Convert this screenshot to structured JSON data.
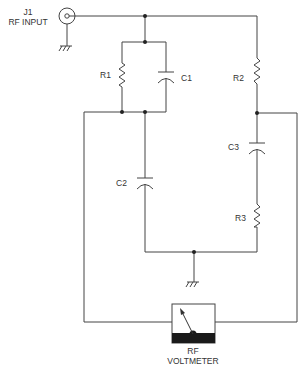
{
  "diagram": {
    "type": "schematic",
    "connector": {
      "ref": "J1",
      "name": "RF INPUT"
    },
    "components": [
      {
        "ref": "R1",
        "kind": "resistor"
      },
      {
        "ref": "C1",
        "kind": "capacitor"
      },
      {
        "ref": "R2",
        "kind": "resistor"
      },
      {
        "ref": "C2",
        "kind": "capacitor"
      },
      {
        "ref": "C3",
        "kind": "capacitor"
      },
      {
        "ref": "R3",
        "kind": "resistor"
      }
    ],
    "meter": {
      "line1": "RF",
      "line2": "VOLTMETER"
    },
    "colors": {
      "line": "#444444",
      "meter_base": "#1a1a1a",
      "background": "#ffffff"
    }
  }
}
